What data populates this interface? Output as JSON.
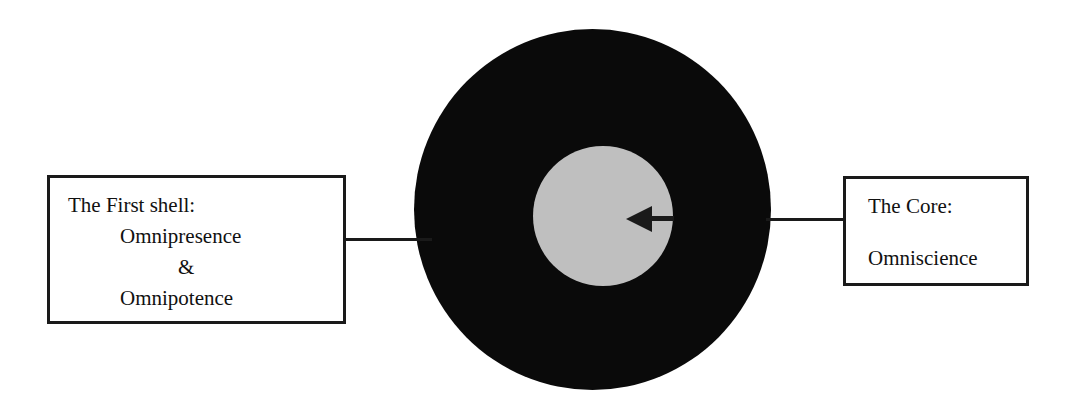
{
  "diagram": {
    "shapes": {
      "outer_shell": {
        "name": "first-shell",
        "fill": "#0a0a0a"
      },
      "core": {
        "name": "core",
        "fill": "#bfbfbf"
      }
    },
    "arrow": {
      "name": "core-pointer-arrow",
      "direction": "left",
      "color": "#1a1a1a"
    },
    "connectors": [
      {
        "name": "first-shell-connector",
        "color": "#1a1a1a"
      },
      {
        "name": "core-connector",
        "color": "#1a1a1a"
      }
    ]
  },
  "left_label": {
    "heading": "The First shell:",
    "item_1": "Omnipresence",
    "conjunction": "&",
    "item_2": "Omnipotence"
  },
  "right_label": {
    "heading": "The Core:",
    "item_1": "Omniscience"
  }
}
